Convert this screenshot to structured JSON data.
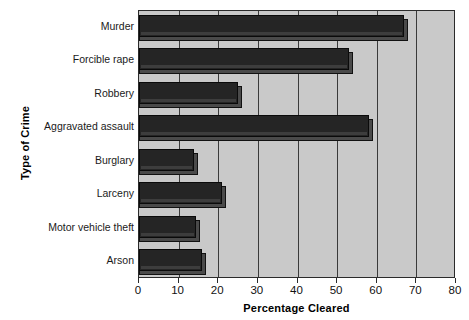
{
  "chart_data": {
    "type": "bar",
    "orientation": "horizontal",
    "title": "",
    "xlabel": "Percentage Cleared",
    "ylabel": "Type of Crime",
    "categories": [
      "Murder",
      "Forcible rape",
      "Robbery",
      "Aggravated assault",
      "Burglary",
      "Larceny",
      "Motor vehicle theft",
      "Arson"
    ],
    "values": [
      67,
      53,
      25,
      58,
      14,
      21,
      14.5,
      16
    ],
    "xlim": [
      0,
      80
    ],
    "xticks": [
      0,
      10,
      20,
      30,
      40,
      50,
      60,
      70,
      80
    ],
    "xtick_labels": [
      "0",
      "10",
      "20",
      "30",
      "40",
      "50",
      "60",
      "70",
      "80"
    ],
    "grid": true,
    "grid_axis": "x",
    "legend": false,
    "bar_color": "#252525",
    "plot_background": "#c9c9c9",
    "figure_background": "#ffffff"
  },
  "axes": {
    "y_title": "Type of Crime",
    "x_title": "Percentage Cleared"
  }
}
